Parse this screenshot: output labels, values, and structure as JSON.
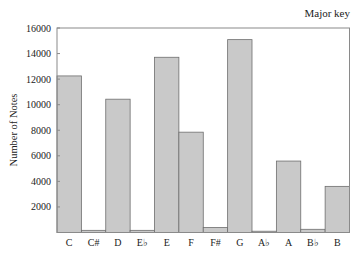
{
  "chart_data": {
    "type": "bar",
    "title": "Major key",
    "xlabel": "",
    "ylabel": "Number of Notes",
    "categories": [
      "C",
      "C#",
      "D",
      "E♭",
      "E",
      "F",
      "F#",
      "G",
      "A♭",
      "A",
      "B♭",
      "B"
    ],
    "values": [
      12250,
      170,
      10430,
      170,
      13710,
      7850,
      390,
      15090,
      100,
      5590,
      250,
      3610
    ],
    "ylim": [
      0,
      16000
    ],
    "yticks": [
      2000,
      4000,
      6000,
      8000,
      10000,
      12000,
      14000,
      16000
    ],
    "ytick_labels": [
      "2000",
      "4000",
      "6000",
      "8000",
      "10000",
      "12000",
      "14000",
      "16000"
    ],
    "grid": false,
    "legend": null,
    "colors": {
      "bar_fill": "#c9c9c9",
      "bar_stroke": "#6e6e6e",
      "axis": "#8a8a8a"
    }
  }
}
